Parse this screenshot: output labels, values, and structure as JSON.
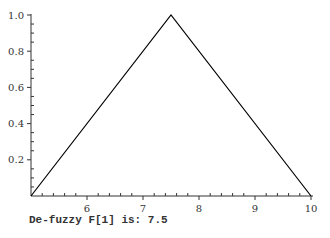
{
  "chart_data": {
    "type": "line",
    "title": "",
    "xlabel": "",
    "ylabel": "",
    "x": [
      5,
      7.5,
      10
    ],
    "series": [
      {
        "name": "F[1] membership",
        "values": [
          0,
          1.0,
          0
        ]
      }
    ],
    "xlim": [
      5,
      10
    ],
    "ylim": [
      0,
      1.0
    ],
    "x_ticks": [
      "6",
      "7",
      "8",
      "9",
      "10"
    ],
    "y_ticks": [
      "0.2",
      "0.4",
      "0.6",
      "0.8",
      "1.0"
    ],
    "grid": false,
    "line_color": "#000000"
  },
  "output": {
    "label": "De-fuzzy F[1] is:",
    "value": "7.5"
  }
}
